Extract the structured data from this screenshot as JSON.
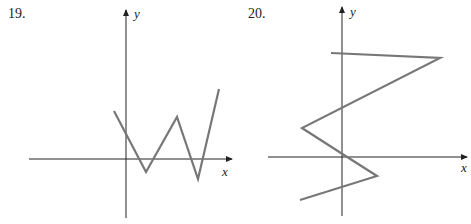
{
  "problems": [
    {
      "number": "19.",
      "x_axis_label": "x",
      "y_axis_label": "y",
      "axes": {
        "origin": [
          126,
          159
        ],
        "x_start": 29,
        "x_end": 232,
        "y_top": 10,
        "y_bottom": 218
      },
      "curve_points": "114,111 146,172 177,117 198,179 219,89",
      "curve_color": "#777777"
    },
    {
      "number": "20.",
      "x_axis_label": "x",
      "y_axis_label": "y",
      "axes": {
        "origin": [
          342,
          157
        ],
        "x_start": 268,
        "x_end": 467,
        "y_top": 7,
        "y_bottom": 216
      },
      "curve_points": "331,53 440,58 302,128 344,155 377,176 300,200",
      "curve_color": "#777777"
    }
  ]
}
